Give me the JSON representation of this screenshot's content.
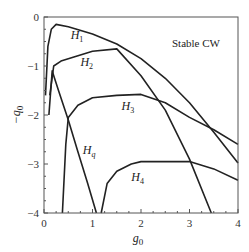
{
  "chart_data": {
    "type": "line",
    "title": "",
    "annotation": "Stable CW",
    "xlabel": "g0",
    "ylabel": "-q0",
    "xlim": [
      0,
      4
    ],
    "ylim": [
      -4,
      0
    ],
    "xticks": [
      "0",
      "1",
      "2",
      "3",
      "4"
    ],
    "yticks": [
      "0",
      "-1",
      "-2",
      "-3",
      "-4"
    ],
    "grid": false,
    "legend": "none (inline curve labels)",
    "series": [
      {
        "name": "H1",
        "x": [
          0.03,
          0.08,
          0.15,
          0.25,
          0.5,
          1.0,
          1.5,
          2.0,
          2.5,
          3.0,
          3.5,
          4.0
        ],
        "y": [
          -1.6,
          -0.6,
          -0.25,
          -0.15,
          -0.2,
          -0.35,
          -0.55,
          -0.85,
          -1.25,
          -1.75,
          -2.35,
          -2.98
        ]
      },
      {
        "name": "H2",
        "x": [
          0.12,
          0.2,
          0.35,
          0.6,
          1.0,
          1.5,
          2.0,
          2.5,
          3.0,
          3.45
        ],
        "y": [
          -1.6,
          -1.0,
          -0.9,
          -0.82,
          -0.7,
          -0.65,
          -1.2,
          -1.9,
          -2.9,
          -4.0
        ]
      },
      {
        "name": "H3",
        "x": [
          0.38,
          0.45,
          0.5,
          0.7,
          1.0,
          1.5,
          2.0,
          2.5,
          3.0,
          3.5,
          4.0
        ],
        "y": [
          -4.0,
          -2.6,
          -2.05,
          -1.8,
          -1.65,
          -1.6,
          -1.58,
          -1.75,
          -2.05,
          -2.3,
          -2.6
        ]
      },
      {
        "name": "Hq",
        "x": [
          0.1,
          0.17,
          0.3,
          0.5,
          0.7,
          0.9,
          1.08
        ],
        "y": [
          -2.0,
          -1.1,
          -1.5,
          -2.1,
          -2.75,
          -3.4,
          -4.0
        ]
      },
      {
        "name": "H4",
        "x": [
          1.18,
          1.3,
          1.5,
          1.8,
          2.0,
          2.5,
          3.0,
          3.5,
          4.0
        ],
        "y": [
          -4.0,
          -3.4,
          -3.15,
          -3.0,
          -2.95,
          -2.95,
          -2.95,
          -3.1,
          -3.33
        ]
      }
    ],
    "curve_labels": [
      {
        "text": "H",
        "sub": "1",
        "x": 0.55,
        "y": -0.45
      },
      {
        "text": "H",
        "sub": "2",
        "x": 0.75,
        "y": -1.0
      },
      {
        "text": "H",
        "sub": "3",
        "x": 1.6,
        "y": -1.9
      },
      {
        "text": "H",
        "sub": "q",
        "x": 0.8,
        "y": -2.8
      },
      {
        "text": "H",
        "sub": "4",
        "x": 1.8,
        "y": -3.35
      }
    ]
  }
}
